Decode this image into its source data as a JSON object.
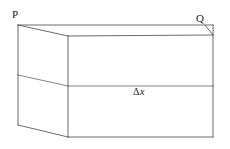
{
  "figure": {
    "name": "rectangular-slab-diagram",
    "background_color": "#ffffff",
    "line_color": "#5a5a5a",
    "text_color": "#1c1c1c",
    "width": 230,
    "height": 149
  },
  "labels": {
    "corner_p": "P",
    "corner_q": "Q",
    "thickness_delta": "Δ",
    "thickness_variable": "x"
  },
  "geometry": {
    "back_top_left": [
      18,
      25
    ],
    "back_top_right": [
      213,
      25
    ],
    "front_top_left": [
      68,
      36
    ],
    "front_top_right": [
      213,
      35
    ],
    "back_mid_left": [
      18,
      75
    ],
    "front_mid_left": [
      68,
      86
    ],
    "front_mid_right": [
      213,
      86
    ],
    "back_bottom_left": [
      18,
      125
    ],
    "front_bottom_left": [
      68,
      137
    ],
    "front_bottom_right": [
      213,
      137
    ]
  }
}
